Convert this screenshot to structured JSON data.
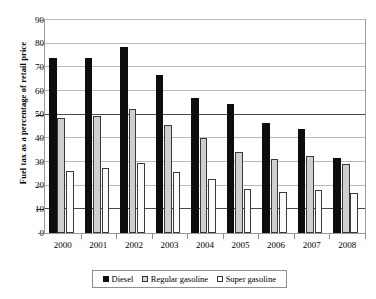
{
  "chart_data": {
    "type": "bar",
    "title": "",
    "xlabel": "",
    "ylabel": "Fuel tax as a percentage of retail price",
    "ylim": [
      0,
      90
    ],
    "ytick_step": 10,
    "yticks": [
      0,
      10,
      20,
      30,
      40,
      50,
      60,
      70,
      80,
      90
    ],
    "grid": true,
    "grid_axis": "y",
    "emphasized_gridlines": [
      50,
      10
    ],
    "legend_position": "bottom",
    "categories": [
      "2000",
      "2001",
      "2002",
      "2003",
      "2004",
      "2005",
      "2006",
      "2007",
      "2008"
    ],
    "series": [
      {
        "name": "Diesel",
        "color": "#0d0d0d",
        "values": [
          74.0,
          74.1,
          78.4,
          66.6,
          57.1,
          54.7,
          46.4,
          43.8,
          31.7
        ]
      },
      {
        "name": "Regular gasoline",
        "color": "#cfcfcf",
        "values": [
          48.5,
          49.3,
          52.4,
          45.6,
          40.3,
          34.1,
          31.3,
          32.4,
          29.3
        ]
      },
      {
        "name": "Super gasoline",
        "color": "#fbfbfb",
        "values": [
          26.2,
          27.3,
          29.7,
          25.6,
          22.8,
          18.8,
          17.5,
          18.2,
          17.0
        ]
      }
    ]
  },
  "legend": {
    "items": [
      {
        "label": "Diesel",
        "swatch": "diesel-swatch-icon"
      },
      {
        "label": "Regular gasoline",
        "swatch": "regular-gasoline-swatch-icon"
      },
      {
        "label": "Super gasoline",
        "swatch": "super-gasoline-swatch-icon"
      }
    ]
  },
  "axes": {
    "y_title": "Fuel tax as a percentage of retail price",
    "y_tick_labels": [
      "90",
      "80",
      "70",
      "60",
      "50",
      "40",
      "30",
      "20",
      "10",
      "0"
    ],
    "x_tick_labels": [
      "2000",
      "2001",
      "2002",
      "2003",
      "2004",
      "2005",
      "2006",
      "2007",
      "2008"
    ]
  },
  "colors": {
    "diesel": "#0d0d0d",
    "regular_gasoline": "#cfcfcf",
    "super_gasoline": "#fbfbfb",
    "grid": "#b9b9b9",
    "grid_major": "#4a4a4a",
    "frame": "#9a9a9a",
    "background": "#ffffff"
  }
}
